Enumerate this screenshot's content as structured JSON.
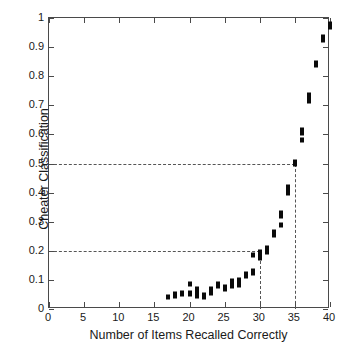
{
  "chart_data": {
    "type": "scatter",
    "title": "",
    "xlabel": "Number of Items Recalled Correctly",
    "ylabel": "Cheater Classification",
    "xlim": [
      0,
      40
    ],
    "ylim": [
      0,
      1
    ],
    "xticks": [
      0,
      5,
      10,
      15,
      20,
      25,
      30,
      35,
      40
    ],
    "yticks": [
      0,
      0.1,
      0.2,
      0.3,
      0.4,
      0.5,
      0.6,
      0.7,
      0.8,
      0.9,
      1
    ],
    "xtick_labels": [
      "0",
      "5",
      "10",
      "15",
      "20",
      "25",
      "30",
      "35",
      "40"
    ],
    "ytick_labels": [
      "0",
      "0.1",
      "0.2",
      "0.3",
      "0.4",
      "0.5",
      "0.6",
      "0.7",
      "0.8",
      "0.9",
      "1"
    ],
    "grid": false,
    "legend": null,
    "marker": "filled-square",
    "marker_color": "#0a0a0a",
    "background_color": "#ffffff",
    "axis_color": "#4a4a4a",
    "points": [
      {
        "x": 17,
        "y": 0.04
      },
      {
        "x": 18,
        "y": 0.045
      },
      {
        "x": 18,
        "y": 0.05
      },
      {
        "x": 19,
        "y": 0.05
      },
      {
        "x": 19,
        "y": 0.055
      },
      {
        "x": 20,
        "y": 0.05
      },
      {
        "x": 20,
        "y": 0.055
      },
      {
        "x": 20,
        "y": 0.085
      },
      {
        "x": 21,
        "y": 0.045
      },
      {
        "x": 21,
        "y": 0.05
      },
      {
        "x": 21,
        "y": 0.06
      },
      {
        "x": 21,
        "y": 0.07
      },
      {
        "x": 22,
        "y": 0.042
      },
      {
        "x": 22,
        "y": 0.048
      },
      {
        "x": 23,
        "y": 0.055
      },
      {
        "x": 23,
        "y": 0.062
      },
      {
        "x": 23,
        "y": 0.07
      },
      {
        "x": 24,
        "y": 0.08
      },
      {
        "x": 24,
        "y": 0.085
      },
      {
        "x": 25,
        "y": 0.07
      },
      {
        "x": 25,
        "y": 0.075
      },
      {
        "x": 26,
        "y": 0.08
      },
      {
        "x": 26,
        "y": 0.085
      },
      {
        "x": 26,
        "y": 0.09
      },
      {
        "x": 26,
        "y": 0.095
      },
      {
        "x": 27,
        "y": 0.082
      },
      {
        "x": 27,
        "y": 0.09
      },
      {
        "x": 27,
        "y": 0.1
      },
      {
        "x": 28,
        "y": 0.115
      },
      {
        "x": 28,
        "y": 0.12
      },
      {
        "x": 29,
        "y": 0.125
      },
      {
        "x": 29,
        "y": 0.13
      },
      {
        "x": 29,
        "y": 0.185
      },
      {
        "x": 30,
        "y": 0.175
      },
      {
        "x": 30,
        "y": 0.185
      },
      {
        "x": 30,
        "y": 0.195
      },
      {
        "x": 31,
        "y": 0.195
      },
      {
        "x": 31,
        "y": 0.205
      },
      {
        "x": 31,
        "y": 0.21
      },
      {
        "x": 32,
        "y": 0.255
      },
      {
        "x": 32,
        "y": 0.265
      },
      {
        "x": 33,
        "y": 0.29
      },
      {
        "x": 33,
        "y": 0.32
      },
      {
        "x": 33,
        "y": 0.33
      },
      {
        "x": 34,
        "y": 0.4
      },
      {
        "x": 34,
        "y": 0.41
      },
      {
        "x": 34,
        "y": 0.42
      },
      {
        "x": 35,
        "y": 0.5
      },
      {
        "x": 35,
        "y": 0.505
      },
      {
        "x": 36,
        "y": 0.58
      },
      {
        "x": 36,
        "y": 0.605
      },
      {
        "x": 36,
        "y": 0.615
      },
      {
        "x": 37,
        "y": 0.715
      },
      {
        "x": 37,
        "y": 0.725
      },
      {
        "x": 37,
        "y": 0.735
      },
      {
        "x": 38,
        "y": 0.84
      },
      {
        "x": 38,
        "y": 0.845
      },
      {
        "x": 39,
        "y": 0.925
      },
      {
        "x": 39,
        "y": 0.935
      },
      {
        "x": 40,
        "y": 0.97
      },
      {
        "x": 40,
        "y": 0.98
      }
    ],
    "reference_lines": [
      {
        "orientation": "horizontal",
        "value": 0.5,
        "x_extent": [
          0,
          35
        ],
        "style": "dashed",
        "color": "#555555"
      },
      {
        "orientation": "horizontal",
        "value": 0.2,
        "x_extent": [
          0,
          30
        ],
        "style": "dashed",
        "color": "#555555"
      },
      {
        "orientation": "vertical",
        "value": 35,
        "y_extent": [
          0,
          0.5
        ],
        "style": "dashed",
        "color": "#555555"
      },
      {
        "orientation": "vertical",
        "value": 30,
        "y_extent": [
          0,
          0.2
        ],
        "style": "dashed",
        "color": "#555555"
      }
    ]
  }
}
